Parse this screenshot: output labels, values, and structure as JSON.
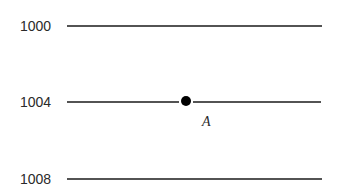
{
  "diagram": {
    "type": "isobar-map",
    "isobars": [
      {
        "value": "1000",
        "y": 26
      },
      {
        "value": "1004",
        "y": 102
      },
      {
        "value": "1008",
        "y": 179
      }
    ],
    "point": {
      "label": "A",
      "x": 186,
      "y": 102
    },
    "line_color": "#1a1a1a"
  }
}
